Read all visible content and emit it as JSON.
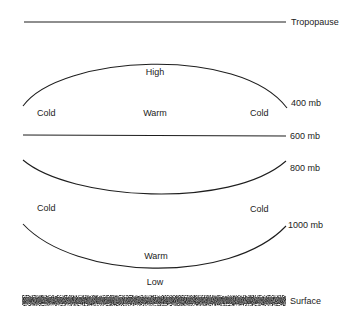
{
  "diagram": {
    "title": "",
    "colors": {
      "line": "#1e1e1e",
      "text": "#222222",
      "surface": "#2a2a2a",
      "background": "#ffffff"
    },
    "levels": {
      "tropopause": {
        "label": "Tropopause"
      },
      "mb400": {
        "label": "400 mb"
      },
      "mb600": {
        "label": "600 mb"
      },
      "mb800": {
        "label": "800 mb"
      },
      "mb1000": {
        "label": "1000 mb"
      },
      "surface": {
        "label": "Surface"
      }
    },
    "annotations": {
      "upper_center": "High",
      "upper_left": "Cold",
      "upper_mid": "Warm",
      "upper_right": "Cold",
      "lower_left": "Cold",
      "lower_right": "Cold",
      "lower_mid": "Warm",
      "lower_center": "Low"
    }
  }
}
